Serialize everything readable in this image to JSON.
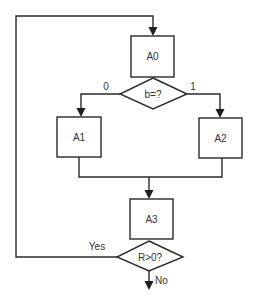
{
  "diagram": {
    "type": "flowchart",
    "nodes": {
      "a0": {
        "kind": "process",
        "label": "A0"
      },
      "decision_b": {
        "kind": "decision",
        "label": "b=?"
      },
      "a1": {
        "kind": "process",
        "label": "A1"
      },
      "a2": {
        "kind": "process",
        "label": "A2"
      },
      "a3": {
        "kind": "process",
        "label": "A3"
      },
      "decision_r": {
        "kind": "decision",
        "label": "R>0?"
      }
    },
    "edges": {
      "b_to_a1": {
        "from": "decision_b",
        "to": "a1",
        "label": "0"
      },
      "b_to_a2": {
        "from": "decision_b",
        "to": "a2",
        "label": "1"
      },
      "a1_to_a3": {
        "from": "a1",
        "to": "a3",
        "label": ""
      },
      "a2_to_a3": {
        "from": "a2",
        "to": "a3",
        "label": ""
      },
      "a0_to_b": {
        "from": "a0",
        "to": "decision_b",
        "label": ""
      },
      "a3_to_r": {
        "from": "a3",
        "to": "decision_r",
        "label": ""
      },
      "r_yes_loop": {
        "from": "decision_r",
        "to": "a0",
        "label": "Yes"
      },
      "r_no_exit": {
        "from": "decision_r",
        "to": "exit",
        "label": "No"
      }
    }
  }
}
